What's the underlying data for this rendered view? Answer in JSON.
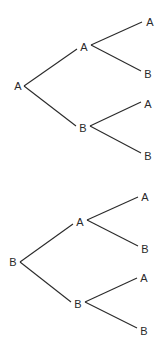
{
  "diagram": {
    "type": "tree-diagram",
    "trees": [
      {
        "root": {
          "label": "A",
          "x": 18,
          "y": 86
        },
        "branches": [
          {
            "label": "A",
            "x": 84,
            "y": 47,
            "children": [
              {
                "label": "A",
                "x": 150,
                "y": 22
              },
              {
                "label": "B",
                "x": 148,
                "y": 74
              }
            ]
          },
          {
            "label": "B",
            "x": 83,
            "y": 128,
            "children": [
              {
                "label": "A",
                "x": 148,
                "y": 104
              },
              {
                "label": "B",
                "x": 148,
                "y": 156
              }
            ]
          }
        ]
      },
      {
        "root": {
          "label": "B",
          "x": 13,
          "y": 262
        },
        "branches": [
          {
            "label": "A",
            "x": 80,
            "y": 222,
            "children": [
              {
                "label": "A",
                "x": 145,
                "y": 197
              },
              {
                "label": "B",
                "x": 145,
                "y": 249
              }
            ]
          },
          {
            "label": "B",
            "x": 78,
            "y": 304,
            "children": [
              {
                "label": "A",
                "x": 144,
                "y": 278
              },
              {
                "label": "B",
                "x": 144,
                "y": 331
              }
            ]
          }
        ]
      }
    ]
  }
}
